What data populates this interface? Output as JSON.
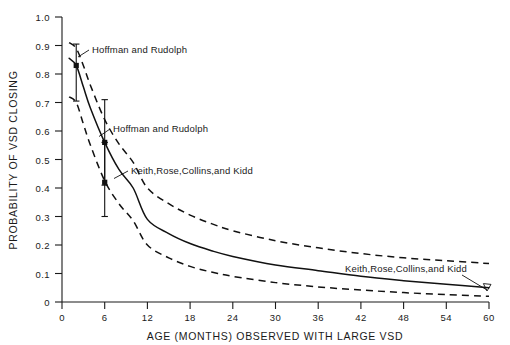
{
  "chart_data": {
    "type": "line",
    "title": "",
    "xlabel": "AGE (MONTHS) OBSERVED WITH LARGE VSD",
    "ylabel": "PROBABILITY OF VSD CLOSING",
    "xlim": [
      0,
      60
    ],
    "ylim": [
      0,
      1.0
    ],
    "grid": false,
    "legend": "none",
    "xticks": [
      0,
      6,
      12,
      18,
      24,
      30,
      36,
      42,
      48,
      54,
      60
    ],
    "xticklabels": [
      "0",
      "6",
      "12",
      "18",
      "24",
      "30",
      "36",
      "42",
      "48",
      "54",
      "60"
    ],
    "yticks": [
      0,
      0.1,
      0.2,
      0.3,
      0.4,
      0.5,
      0.6,
      0.7,
      0.8,
      0.9,
      1.0
    ],
    "yticklabels": [
      "0",
      "0.1",
      "0.2",
      "0.3",
      "0.4",
      "0.5",
      "0.6",
      "0.7",
      "0.8",
      "0.9",
      "1.0"
    ],
    "x": [
      1,
      2,
      3,
      4,
      6,
      8,
      10,
      12,
      15,
      18,
      21,
      24,
      30,
      36,
      42,
      48,
      54,
      60
    ],
    "series": [
      {
        "name": "upper 95% confidence limit",
        "style": "dashed",
        "values": [
          0.91,
          0.89,
          0.83,
          0.76,
          0.64,
          0.555,
          0.49,
          0.4,
          0.345,
          0.305,
          0.275,
          0.25,
          0.215,
          0.19,
          0.17,
          0.155,
          0.145,
          0.135
        ]
      },
      {
        "name": "estimated probability",
        "style": "solid",
        "values": [
          0.855,
          0.83,
          0.755,
          0.68,
          0.56,
          0.465,
          0.4,
          0.29,
          0.24,
          0.205,
          0.18,
          0.16,
          0.13,
          0.11,
          0.09,
          0.075,
          0.062,
          0.05
        ]
      },
      {
        "name": "lower 95% confidence limit",
        "style": "dashed",
        "values": [
          0.72,
          0.7,
          0.625,
          0.55,
          0.425,
          0.345,
          0.285,
          0.2,
          0.155,
          0.125,
          0.105,
          0.09,
          0.068,
          0.053,
          0.042,
          0.033,
          0.026,
          0.02
        ]
      }
    ],
    "points": [
      {
        "label": "Hoffman and Rudolph",
        "x": 2,
        "y": 0.83,
        "yerr_low": 0.705,
        "yerr_high": 0.905
      },
      {
        "label": "Hoffman and Rudolph",
        "x": 6,
        "y": 0.56,
        "yerr_low": 0.41,
        "yerr_high": 0.71
      },
      {
        "label": "Keith,Rose,Collins,and Kidd",
        "x": 6,
        "y": 0.42,
        "yerr_low": 0.3,
        "yerr_high": 0.56
      }
    ],
    "annotations": [
      {
        "id": "annot-hoffman-1",
        "text": "Hoffman and Rudolph",
        "text_x": 92,
        "text_y": 53
      },
      {
        "id": "annot-hoffman-2",
        "text": "Hoffman and Rudolph",
        "text_x": 113,
        "text_y": 132
      },
      {
        "id": "annot-keith-1",
        "text": "Keith,Rose,Collins,and Kidd",
        "text_x": 131,
        "text_y": 174
      },
      {
        "id": "annot-keith-2",
        "text": "Keith,Rose,Collins,and Kidd",
        "text_x": 345,
        "text_y": 272
      }
    ],
    "colors": {
      "line": "#111111",
      "axis": "#1a1a1a",
      "background": "#ffffff"
    }
  }
}
